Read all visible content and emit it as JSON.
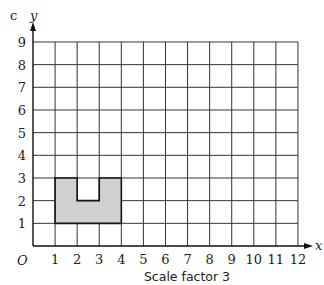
{
  "part_label": "c",
  "axes": {
    "x_label": "x",
    "y_label": "y",
    "origin_label": "O",
    "x_ticks": [
      "1",
      "2",
      "3",
      "4",
      "5",
      "6",
      "7",
      "8",
      "9",
      "10",
      "11",
      "12"
    ],
    "y_ticks": [
      "1",
      "2",
      "3",
      "4",
      "5",
      "6",
      "7",
      "8",
      "9"
    ]
  },
  "shape": {
    "description": "Shaded U-shaped polygon",
    "vertices": [
      [
        1,
        1
      ],
      [
        4,
        1
      ],
      [
        4,
        3
      ],
      [
        3,
        3
      ],
      [
        3,
        2
      ],
      [
        2,
        2
      ],
      [
        2,
        3
      ],
      [
        1,
        3
      ]
    ],
    "fill": "#d0d0d0"
  },
  "caption": "Scale factor 3"
}
